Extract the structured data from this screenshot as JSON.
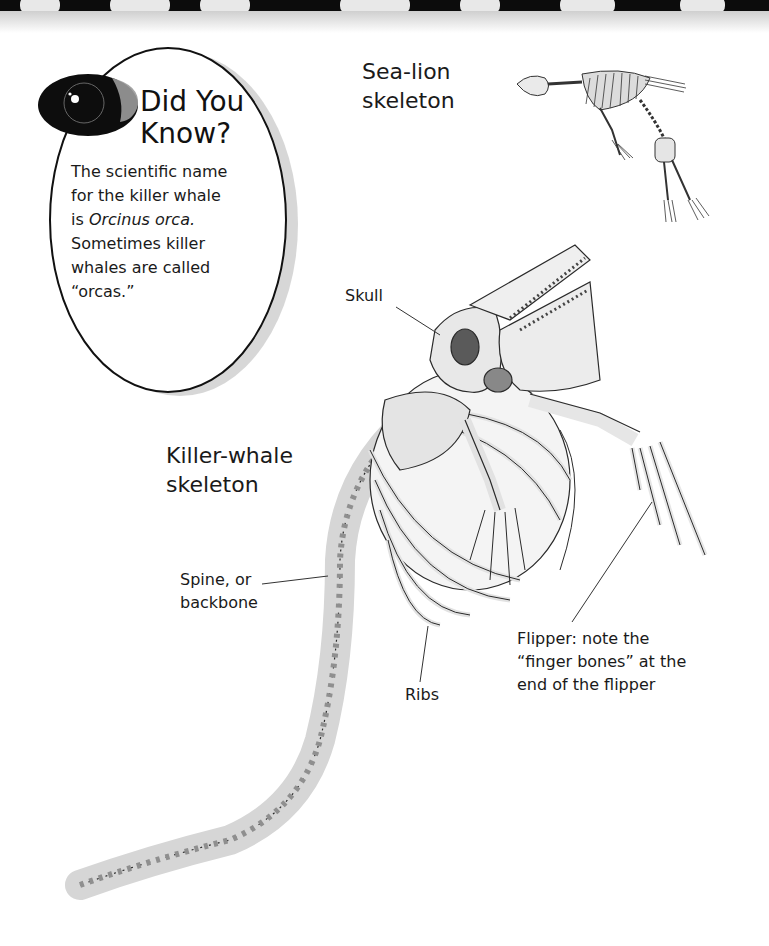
{
  "did_you_know": {
    "title_line1": "Did You",
    "title_line2": "Know?",
    "body_line1": "The scientific name",
    "body_line2": "for the killer whale",
    "body_line3_prefix": "is ",
    "body_line3_italic": "Orcinus orca.",
    "body_line4": "Sometimes killer",
    "body_line5": "whales are called",
    "body_line6": "“orcas.”",
    "icon": "eye-icon"
  },
  "sea_lion": {
    "caption": "Sea-lion\nskeleton"
  },
  "killer_whale": {
    "caption": "Killer-whale\nskeleton",
    "labels": {
      "skull": "Skull",
      "spine": "Spine, or\nbackbone",
      "ribs": "Ribs",
      "flipper": "Flipper: note the\n“finger bones” at the\nend of the flipper"
    }
  },
  "colors": {
    "ink": "#1a1a1a",
    "bone": "#e9e9e9",
    "bone_shadow": "#a8a8a8",
    "band": "#0c0c0c"
  }
}
